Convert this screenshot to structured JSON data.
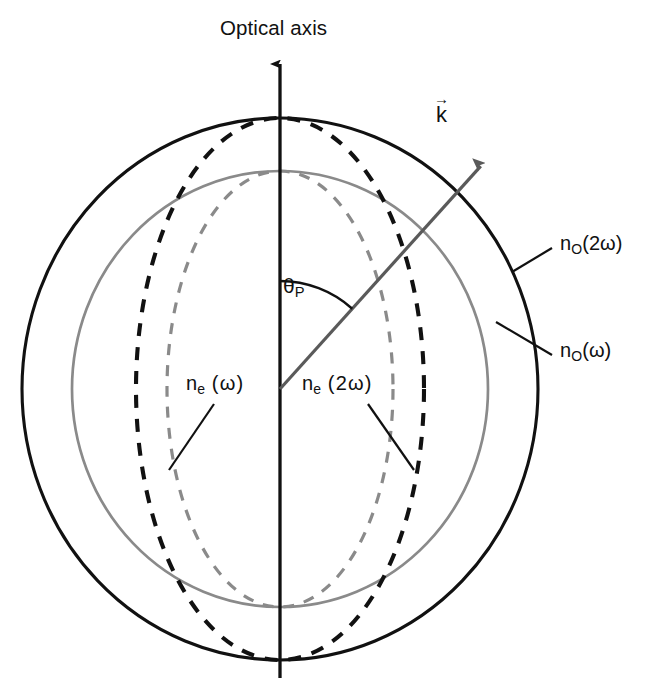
{
  "figure": {
    "kind": "optical-index-surface-phase-matching-diagram",
    "background_color": "#ffffff"
  },
  "colors": {
    "black": "#111111",
    "gray": "#8a8a8a",
    "axis": "#111111",
    "ray": "#5a5a5a"
  },
  "axis": {
    "title": "Optical axis"
  },
  "wavevector": {
    "symbol": "k",
    "arrow": "→"
  },
  "angle": {
    "symbol": "θ",
    "subscript": "P"
  },
  "curves": {
    "no_2w": {
      "label_prefix": "n",
      "label_sub": "O",
      "label_suffix": "(2ω)",
      "style": "solid",
      "color": "#111111",
      "shape": "circle"
    },
    "no_w": {
      "label_prefix": "n",
      "label_sub": "O",
      "label_suffix": "(ω)",
      "style": "solid",
      "color": "#8a8a8a",
      "shape": "circle"
    },
    "ne_2w": {
      "label_prefix": "n",
      "label_sub": "e",
      "label_suffix": " (2ω)",
      "style": "dashed",
      "color": "#111111",
      "shape": "ellipse"
    },
    "ne_w": {
      "label_prefix": "n",
      "label_sub": "e",
      "label_suffix": " (ω)",
      "style": "dashed",
      "color": "#8a8a8a",
      "shape": "ellipse"
    }
  },
  "chart_data": {
    "type": "scatter",
    "xlabel": "",
    "ylabel": "",
    "center": {
      "x": 280,
      "y": 389
    },
    "axis_line": {
      "x": 280,
      "y_top": 52,
      "y_bottom": 678
    },
    "series": [
      {
        "name": "n_O(2ω)",
        "shape": "circle",
        "style": "solid",
        "color": "#111111",
        "semi_x": 258,
        "semi_y": 271
      },
      {
        "name": "n_O(ω)",
        "shape": "circle",
        "style": "solid",
        "color": "#8a8a8a",
        "semi_x": 208,
        "semi_y": 218
      },
      {
        "name": "n_e(2ω)",
        "shape": "ellipse",
        "style": "dashed",
        "color": "#111111",
        "semi_x": 144,
        "semi_y": 271
      },
      {
        "name": "n_e(ω)",
        "shape": "ellipse",
        "style": "dashed",
        "color": "#8a8a8a",
        "semi_x": 113,
        "semi_y": 218
      }
    ],
    "ray": {
      "name": "k-vector",
      "angle_from_axis_deg": 42,
      "length": 300,
      "color": "#5a5a5a"
    },
    "angle_arc": {
      "name": "theta_P",
      "radius": 108,
      "from_deg": 0,
      "to_deg": 42
    },
    "legend_position": "inline-annotations",
    "grid": false
  },
  "annotations": [
    {
      "name": "no-2w-label",
      "text_prefix": "n",
      "text_sub": "O",
      "text_suffix": "(2ω)",
      "x": 560,
      "y": 243
    },
    {
      "name": "no-w-label",
      "text_prefix": "n",
      "text_sub": "O",
      "text_suffix": "(ω)",
      "x": 560,
      "y": 350
    },
    {
      "name": "ne-w-label",
      "text_prefix": "n",
      "text_sub": "e",
      "text_suffix": " (ω)",
      "x": 186,
      "y": 383
    },
    {
      "name": "ne-2w-label",
      "text_prefix": "n",
      "text_sub": "e",
      "text_suffix": " (2ω)",
      "x": 302,
      "y": 383
    }
  ]
}
